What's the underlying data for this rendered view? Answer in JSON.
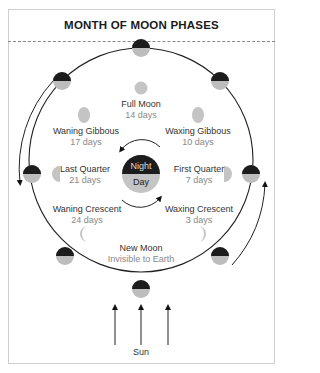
{
  "title": "MONTH OF MOON PHASES",
  "colors": {
    "dark": "#1c1c1c",
    "light": "#bdbdbd",
    "line": "#222222"
  },
  "earth": {
    "night_label": "Night",
    "day_label": "Day"
  },
  "phases": [
    {
      "name": "Full Moon",
      "days": "14 days"
    },
    {
      "name": "Waning Gibbous",
      "days": "17 days"
    },
    {
      "name": "Waxing Gibbous",
      "days": "10 days"
    },
    {
      "name": "Last Quarter",
      "days": "21 days"
    },
    {
      "name": "First Quarter",
      "days": "7 days"
    },
    {
      "name": "Waning Crescent",
      "days": "24 days"
    },
    {
      "name": "Waxing Crescent",
      "days": "3 days"
    },
    {
      "name": "New Moon",
      "days": "Invisible to Earth"
    }
  ],
  "sun_label": "Sun"
}
